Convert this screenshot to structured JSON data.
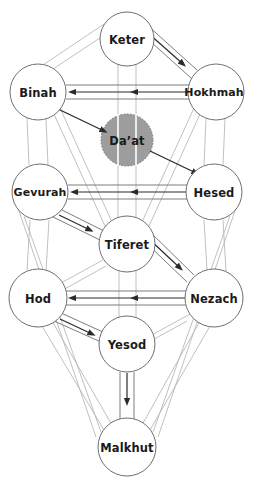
{
  "diagram": {
    "type": "node-link-diagram",
    "canvas": {
      "width": 253,
      "height": 489,
      "background": "#ffffff"
    },
    "colors": {
      "node_stroke": "#6f6f6f",
      "node_fill": "#ffffff",
      "label_text": "#1a1a1a",
      "faint_edge": "#b9b9b9",
      "bold_edge": "#2a2a2a",
      "daat_fill": "#9d9d9d",
      "daat_stroke": "#6f6f6f"
    },
    "nodes": [
      {
        "id": "keter",
        "label": "Keter",
        "x": 127,
        "y": 39,
        "r": 27,
        "style": "open"
      },
      {
        "id": "binah",
        "label": "Binah",
        "x": 38,
        "y": 92,
        "r": 28,
        "style": "open"
      },
      {
        "id": "hokhmah",
        "label": "Hokhmah",
        "x": 216,
        "y": 92,
        "r": 28,
        "style": "open"
      },
      {
        "id": "daat",
        "label": "Da’at",
        "x": 127,
        "y": 140,
        "r": 26,
        "style": "shaded-dashed"
      },
      {
        "id": "gevurah",
        "label": "Gevurah",
        "x": 40,
        "y": 192,
        "r": 28,
        "style": "open"
      },
      {
        "id": "hesed",
        "label": "Hesed",
        "x": 214,
        "y": 192,
        "r": 28,
        "style": "open"
      },
      {
        "id": "tiferet",
        "label": "Tiferet",
        "x": 127,
        "y": 244,
        "r": 28,
        "style": "open"
      },
      {
        "id": "hod",
        "label": "Hod",
        "x": 38,
        "y": 298,
        "r": 29,
        "style": "open"
      },
      {
        "id": "nezach",
        "label": "Nezach",
        "x": 214,
        "y": 298,
        "r": 29,
        "style": "open"
      },
      {
        "id": "yesod",
        "label": "Yesod",
        "x": 127,
        "y": 344,
        "r": 28,
        "style": "open"
      },
      {
        "id": "malkhut",
        "label": "Malkhut",
        "x": 127,
        "y": 447,
        "r": 29,
        "style": "open"
      }
    ],
    "arrow_edges": [
      {
        "from": "keter",
        "to": "hokhmah",
        "kind": "double-line",
        "arrows": 1
      },
      {
        "from": "hokhmah",
        "to": "binah",
        "kind": "double-line",
        "arrows": 2
      },
      {
        "from": "binah",
        "to": "daat",
        "kind": "single-line",
        "arrows": 1
      },
      {
        "from": "daat",
        "to": "hesed",
        "kind": "single-line",
        "arrows": 1
      },
      {
        "from": "hesed",
        "to": "gevurah",
        "kind": "double-line",
        "arrows": 2
      },
      {
        "from": "gevurah",
        "to": "tiferet",
        "kind": "double-line",
        "arrows": 1
      },
      {
        "from": "tiferet",
        "to": "nezach",
        "kind": "double-line",
        "arrows": 1
      },
      {
        "from": "nezach",
        "to": "hod",
        "kind": "double-line",
        "arrows": 2
      },
      {
        "from": "hod",
        "to": "yesod",
        "kind": "double-line",
        "arrows": 1
      },
      {
        "from": "yesod",
        "to": "malkhut",
        "kind": "double-line",
        "arrows": 1
      }
    ],
    "plain_edges": [
      {
        "from": "keter",
        "to": "binah"
      },
      {
        "from": "keter",
        "to": "tiferet"
      },
      {
        "from": "binah",
        "to": "gevurah"
      },
      {
        "from": "binah",
        "to": "tiferet"
      },
      {
        "from": "hokhmah",
        "to": "hesed"
      },
      {
        "from": "hokhmah",
        "to": "tiferet"
      },
      {
        "from": "gevurah",
        "to": "hod"
      },
      {
        "from": "hesed",
        "to": "nezach"
      },
      {
        "from": "tiferet",
        "to": "hod"
      },
      {
        "from": "tiferet",
        "to": "yesod"
      },
      {
        "from": "nezach",
        "to": "yesod"
      },
      {
        "from": "hod",
        "to": "malkhut"
      },
      {
        "from": "nezach",
        "to": "malkhut"
      },
      {
        "from": "gevurah",
        "to": "malkhut"
      },
      {
        "from": "hesed",
        "to": "malkhut"
      }
    ]
  }
}
